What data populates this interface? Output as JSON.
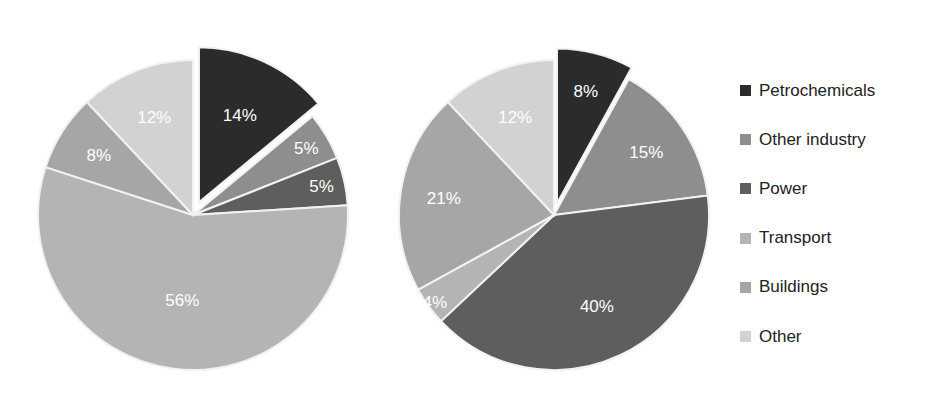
{
  "chart_data": [
    {
      "type": "pie",
      "title": "",
      "categories": [
        "Petrochemicals",
        "Other industry",
        "Power",
        "Transport",
        "Buildings",
        "Other"
      ],
      "values": [
        14,
        5,
        5,
        56,
        8,
        12
      ],
      "labels": [
        "14%",
        "5%",
        "5%",
        "56%",
        "8%",
        "12%"
      ],
      "exploded": [
        "Petrochemicals"
      ],
      "start_angle_deg": 0,
      "direction": "clockwise"
    },
    {
      "type": "pie",
      "title": "",
      "categories": [
        "Petrochemicals",
        "Other industry",
        "Power",
        "Transport",
        "Buildings",
        "Other"
      ],
      "values": [
        8,
        15,
        40,
        4,
        21,
        12
      ],
      "labels": [
        "8%",
        "15%",
        "40%",
        "4%",
        "21%",
        "12%"
      ],
      "exploded": [
        "Petrochemicals"
      ],
      "start_angle_deg": 0,
      "direction": "clockwise"
    }
  ],
  "legend": {
    "position": "right",
    "items": [
      {
        "label": "Petrochemicals",
        "color": "#2b2b2b"
      },
      {
        "label": "Other industry",
        "color": "#8e8e8e"
      },
      {
        "label": "Power",
        "color": "#5e5e5e"
      },
      {
        "label": "Transport",
        "color": "#b4b4b4"
      },
      {
        "label": "Buildings",
        "color": "#a6a6a6"
      },
      {
        "label": "Other",
        "color": "#d2d2d2"
      }
    ]
  }
}
